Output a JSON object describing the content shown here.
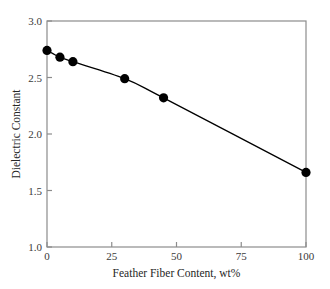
{
  "chart_data": {
    "type": "line",
    "title": "",
    "xlabel": "Feather Fiber Content, wt%",
    "ylabel": "Dielectric Constant",
    "x": [
      0,
      5,
      10,
      30,
      45,
      100
    ],
    "values": [
      2.74,
      2.68,
      2.64,
      2.49,
      2.32,
      1.66
    ],
    "series": [
      {
        "name": "Dielectric Constant",
        "x": [
          0,
          5,
          10,
          30,
          45,
          100
        ],
        "values": [
          2.74,
          2.68,
          2.64,
          2.49,
          2.32,
          1.66
        ]
      }
    ],
    "xlim": [
      0,
      100
    ],
    "ylim": [
      1.0,
      3.0
    ],
    "xticks": [
      0,
      25,
      50,
      75,
      100
    ],
    "yticks": [
      1.0,
      1.5,
      2.0,
      2.5,
      3.0
    ],
    "xtick_labels": [
      "0",
      "25",
      "50",
      "75",
      "100"
    ],
    "ytick_labels": [
      "1.0",
      "1.5",
      "2.0",
      "2.5",
      "3.0"
    ],
    "grid": false,
    "legend": false,
    "marker": "filled-circle",
    "marker_color": "#000000",
    "line_color": "#000000",
    "frame_color": "#8c8c8c",
    "background_color": "#ffffff"
  },
  "axes": {
    "x_title": "Feather Fiber Content, wt%",
    "y_title": "Dielectric Constant",
    "x_tick_0": "0",
    "x_tick_1": "25",
    "x_tick_2": "50",
    "x_tick_3": "75",
    "x_tick_4": "100",
    "y_tick_0": "1.0",
    "y_tick_1": "1.5",
    "y_tick_2": "2.0",
    "y_tick_3": "2.5",
    "y_tick_4": "3.0"
  }
}
